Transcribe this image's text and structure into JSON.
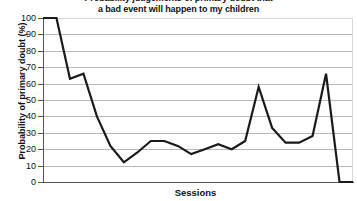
{
  "chart_data": {
    "type": "line",
    "title": "Probability judgements of primary doubt that\na bad event will happen to my children",
    "title_line1": "Probability judgements of primary doubt that",
    "title_line2": "a bad event will happen to my children",
    "xlabel": "Sessions",
    "ylabel": "Probability of primary doubt (%)",
    "ylim": [
      0,
      100
    ],
    "ytick_labels": [
      "100",
      "90",
      "80",
      "70",
      "60",
      "50",
      "40",
      "30",
      "20",
      "10",
      "0"
    ],
    "ytick_values": [
      100,
      90,
      80,
      70,
      60,
      50,
      40,
      30,
      20,
      10,
      0
    ],
    "xtick_labels": [],
    "grid": true,
    "grid_axis": "y",
    "legend": false,
    "line_color": "#1a1a1a",
    "line_width": 2.2,
    "markers": false,
    "x": [
      1,
      2,
      3,
      4,
      5,
      6,
      7,
      8,
      9,
      10,
      11,
      12,
      13,
      14,
      15,
      16,
      17,
      18,
      19,
      20,
      21,
      22,
      23,
      24
    ],
    "values": [
      100,
      100,
      63,
      66,
      40,
      22,
      12,
      18,
      25,
      25,
      22,
      17,
      20,
      23,
      20,
      25,
      58,
      33,
      24,
      24,
      28,
      66,
      0,
      0
    ],
    "series": [
      {
        "name": "Primary doubt",
        "values": [
          100,
          100,
          63,
          66,
          40,
          22,
          12,
          18,
          25,
          25,
          22,
          17,
          20,
          23,
          20,
          25,
          58,
          33,
          24,
          24,
          28,
          66,
          0,
          0
        ]
      }
    ]
  }
}
